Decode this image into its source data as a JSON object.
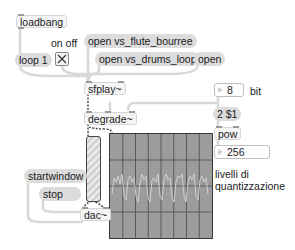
{
  "patch": {
    "objects": {
      "loadbang": "loadbang",
      "sfplay": "sfplay~",
      "degrade": "degrade~",
      "pow": "pow",
      "dac": "dac~"
    },
    "messages": {
      "loop": "loop 1",
      "open_flute": "open vs_flute_bourree",
      "open_drums": "open vs_drums_loop",
      "open": "open",
      "two_dollar": "2 $1",
      "startwindow": "startwindow",
      "stop": "stop"
    },
    "toggle": {
      "label": "on off",
      "state": "on"
    },
    "bit_number": {
      "value": "8",
      "label": "bit"
    },
    "levels_number": {
      "value": "256"
    },
    "comments": {
      "levels_line1": "livelli di",
      "levels_line2": "quantizzazione"
    },
    "scope": {
      "background": "#9c9c9c",
      "grid": "#5a5a5a",
      "trace": "#c9c9c9",
      "cols": 8,
      "rows": 4
    }
  }
}
